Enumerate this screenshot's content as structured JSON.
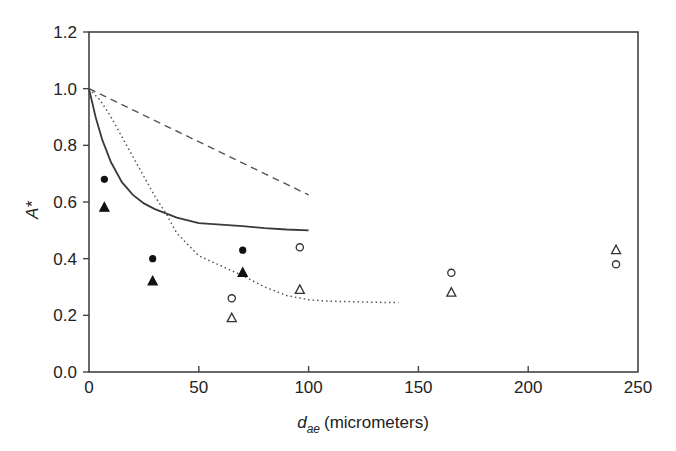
{
  "chart_data": {
    "type": "scatter",
    "title": "",
    "xlabel": "d_ae (micrometers)",
    "xlabel_main": "d",
    "xlabel_sub": "ae",
    "xlabel_unit": "(micrometers)",
    "ylabel": "A*",
    "xlim": [
      0,
      250
    ],
    "ylim": [
      0.0,
      1.2
    ],
    "x_ticks": [
      0,
      50,
      100,
      150,
      200,
      250
    ],
    "x_tick_labels": [
      "0",
      "50",
      "100",
      "150",
      "200",
      "250"
    ],
    "y_ticks": [
      0.0,
      0.2,
      0.4,
      0.6,
      0.8,
      1.0,
      1.2
    ],
    "y_tick_labels": [
      "0.0",
      "0.2",
      "0.4",
      "0.6",
      "0.8",
      "1.0",
      "1.2"
    ],
    "grid": false,
    "legend": null,
    "series": [
      {
        "name": "filled-circle",
        "kind": "scatter",
        "marker": "circle-filled",
        "x": [
          7,
          29,
          70
        ],
        "y": [
          0.68,
          0.4,
          0.43
        ]
      },
      {
        "name": "filled-triangle",
        "kind": "scatter",
        "marker": "triangle-filled",
        "x": [
          7,
          29,
          70
        ],
        "y": [
          0.58,
          0.32,
          0.35
        ]
      },
      {
        "name": "open-circle",
        "kind": "scatter",
        "marker": "circle-open",
        "x": [
          65,
          96,
          165,
          240
        ],
        "y": [
          0.26,
          0.44,
          0.35,
          0.38
        ]
      },
      {
        "name": "open-triangle",
        "kind": "scatter",
        "marker": "triangle-open",
        "x": [
          65,
          96,
          165,
          240
        ],
        "y": [
          0.19,
          0.29,
          0.28,
          0.43
        ]
      },
      {
        "name": "dashed-line",
        "kind": "line",
        "style": "dashed",
        "x": [
          0,
          100
        ],
        "y": [
          1.0,
          0.625
        ]
      },
      {
        "name": "solid-line",
        "kind": "line",
        "style": "solid",
        "x": [
          0,
          3,
          6,
          10,
          15,
          20,
          25,
          30,
          35,
          40,
          50,
          60,
          70,
          80,
          90,
          100
        ],
        "y": [
          1.0,
          0.9,
          0.82,
          0.74,
          0.67,
          0.625,
          0.595,
          0.575,
          0.56,
          0.545,
          0.525,
          0.52,
          0.515,
          0.508,
          0.503,
          0.5
        ]
      },
      {
        "name": "dotted-line",
        "kind": "line",
        "style": "dotted",
        "x": [
          0,
          5,
          10,
          15,
          20,
          25,
          30,
          35,
          40,
          50,
          60,
          70,
          80,
          90,
          100,
          110,
          120,
          130,
          141
        ],
        "y": [
          1.0,
          0.96,
          0.9,
          0.83,
          0.76,
          0.69,
          0.62,
          0.56,
          0.49,
          0.41,
          0.375,
          0.34,
          0.3,
          0.27,
          0.255,
          0.25,
          0.248,
          0.246,
          0.245
        ]
      }
    ]
  }
}
